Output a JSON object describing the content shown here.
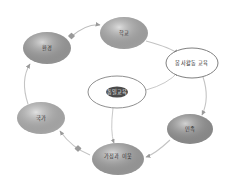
{
  "diagram": {
    "type": "cycle-diagram",
    "title": "",
    "background": "#ffffff",
    "center": {
      "id": "center",
      "label": "통일교육",
      "highlight": true,
      "fill": "#ffffff",
      "stroke": "#8f8f8f",
      "cx": 117,
      "cy": 92,
      "rx": 29,
      "ry": 16
    },
    "nodes": [
      {
        "id": "school",
        "label": "학교",
        "fill": "#b4b4b4",
        "stroke": "none",
        "cx": 124,
        "cy": 33,
        "rx": 24,
        "ry": 16
      },
      {
        "id": "service-education",
        "label": "봉사활동 교육",
        "fill": "#ffffff",
        "stroke": "#7f7f7f",
        "cx": 192,
        "cy": 63,
        "rx": 26,
        "ry": 15
      },
      {
        "id": "ethnicity",
        "label": "민족",
        "fill": "#9b9b9b",
        "stroke": "none",
        "cx": 190,
        "cy": 129,
        "rx": 23,
        "ry": 15
      },
      {
        "id": "family-neighbor",
        "label": "가정과 이웃",
        "fill": "#a9a9a9",
        "stroke": "none",
        "cx": 118,
        "cy": 159,
        "rx": 26,
        "ry": 16
      },
      {
        "id": "nation",
        "label": "국가",
        "fill": "#bcbcbc",
        "stroke": "none",
        "cx": 41,
        "cy": 118,
        "rx": 24,
        "ry": 16
      },
      {
        "id": "environment",
        "label": "환경",
        "fill": "#a6a6a6",
        "stroke": "none",
        "cx": 47,
        "cy": 48,
        "rx": 24,
        "ry": 16
      }
    ],
    "edges": [
      {
        "id": "e-school-service",
        "from": "school",
        "to": "service-education",
        "label": ""
      },
      {
        "id": "e-service-ethnic",
        "from": "service-education",
        "to": "ethnicity",
        "label": ""
      },
      {
        "id": "e-ethnic-family",
        "from": "ethnicity",
        "to": "family-neighbor",
        "label": ""
      },
      {
        "id": "e-family-nation",
        "from": "family-neighbor",
        "to": "nation",
        "label": ""
      },
      {
        "id": "e-nation-env",
        "from": "nation",
        "to": "environment",
        "label": ""
      },
      {
        "id": "e-env-school",
        "from": "environment",
        "to": "school",
        "label": ""
      },
      {
        "id": "e-center-service",
        "from": "center",
        "to": "service-education",
        "label": ""
      },
      {
        "id": "e-center-family",
        "from": "center",
        "to": "family-neighbor",
        "label": ""
      }
    ],
    "markers": {
      "arrowhead_color": "#9a9a9a",
      "node_marker_color": "#9a9a9a",
      "edge_color": "#b9b9b9"
    }
  }
}
